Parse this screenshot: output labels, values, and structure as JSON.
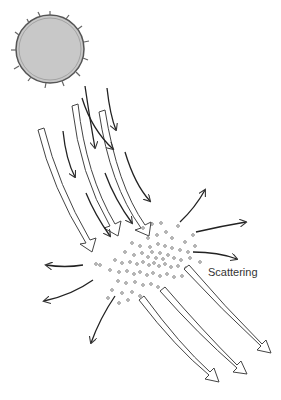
{
  "diagram": {
    "labels": {
      "scattering": "Scattering"
    },
    "elements": {
      "sun": "sun-icon",
      "incoming_light": "incoming-light-rays",
      "particles": "particle-cloud",
      "scattered_rays": "scattered-light-arrows",
      "transmitted_light": "transmitted-light-rays"
    },
    "colors": {
      "sun_fill": "#c8c8c8",
      "stroke": "#333333",
      "background": "#ffffff"
    }
  }
}
